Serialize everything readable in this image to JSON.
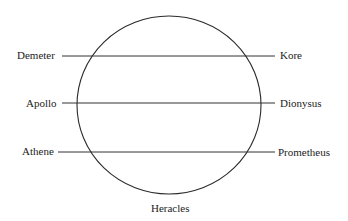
{
  "diagram": {
    "circle": {
      "cx": 169,
      "cy": 105,
      "rx": 92,
      "ry": 89,
      "stroke": "#2a2a2a"
    },
    "lines": [
      {
        "id": "demeter-kore",
        "y": 56,
        "x1": 62,
        "x2": 275,
        "left": "Demeter",
        "right": "Kore"
      },
      {
        "id": "apollo-dionysus",
        "y": 103,
        "x1": 62,
        "x2": 275,
        "left": "Apollo",
        "right": "Dionysus"
      },
      {
        "id": "athene-prometheus",
        "y": 152,
        "x1": 58,
        "x2": 275,
        "left": "Athene",
        "right": "Prometheus"
      }
    ],
    "bottom_label": "Heracles",
    "line_color": "#333333",
    "text_color": "#1c1c1c"
  }
}
